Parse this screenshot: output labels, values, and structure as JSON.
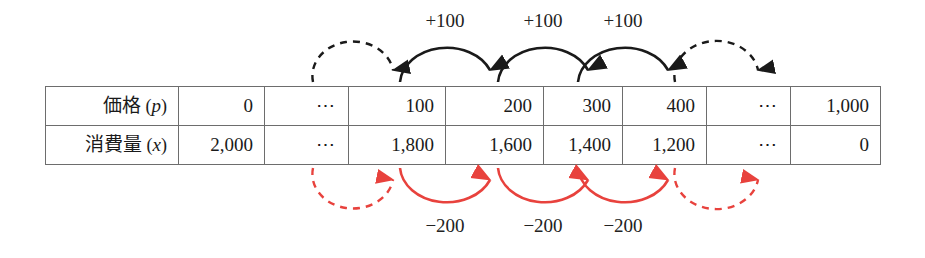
{
  "figure": {
    "kind": "table-with-delta-arrows",
    "colors": {
      "table_border": "#6d6d6d",
      "text": "#1a1a1a",
      "top_arrow": "#1a1a1a",
      "bottom_arrow": "#e8423d",
      "label": "#222222"
    }
  },
  "table": {
    "rows": [
      {
        "header_label": "価格",
        "header_symbol": "p",
        "cells": [
          "0",
          "⋯",
          "100",
          "200",
          "300",
          "400",
          "⋯",
          "1,000"
        ]
      },
      {
        "header_label": "消費量",
        "header_symbol": "x",
        "cells": [
          "2,000",
          "⋯",
          "1,800",
          "1,600",
          "1,400",
          "1,200",
          "⋯",
          "0"
        ]
      }
    ]
  },
  "top_arrows": {
    "labels": [
      "+100",
      "+100",
      "+100"
    ],
    "style_note": "solid arcs carry labels; first and last arcs are dashed and unlabeled"
  },
  "bottom_arrows": {
    "labels": [
      "−200",
      "−200",
      "−200"
    ],
    "style_note": "solid arcs carry labels; first and last arcs are dashed and unlabeled"
  }
}
